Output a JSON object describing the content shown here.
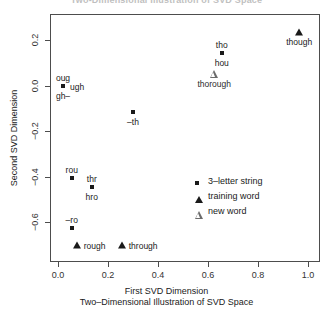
{
  "clipped_title": "Two-Dimensional Illustration of SVD Space",
  "axes": {
    "xlabel": "First SVD Dimension",
    "sublabel": "Two–Dimensional Illustration of SVD Space",
    "ylabel": "Second SVD Dimension",
    "xticks": [
      "0.0",
      "0.2",
      "0.4",
      "0.6",
      "0.8",
      "1.0"
    ],
    "yticks": [
      "0.2",
      "0.0",
      "−0.2",
      "−0.4",
      "−0.6"
    ]
  },
  "legend": {
    "items": [
      {
        "label": "3–letter string",
        "marker": "filled-square"
      },
      {
        "label": "training word",
        "marker": "filled-triangle"
      },
      {
        "label": "new word",
        "marker": "open-triangle"
      }
    ]
  },
  "chart_data": {
    "type": "scatter",
    "title": "Two-Dimensional Illustration of SVD Space",
    "xlabel": "First SVD Dimension",
    "ylabel": "Second SVD Dimension",
    "xlim": [
      -0.05,
      1.06
    ],
    "ylim": [
      -0.76,
      0.31
    ],
    "xticks": [
      0.0,
      0.2,
      0.4,
      0.6,
      0.8,
      1.0
    ],
    "yticks": [
      0.2,
      0.0,
      -0.2,
      -0.4,
      -0.6
    ],
    "grid": false,
    "legend_position": "center-right",
    "series": [
      {
        "name": "3–letter string",
        "marker": "filled-square",
        "color": "#1a1a1a",
        "points": [
          {
            "label": "oug",
            "x": 0.02,
            "y": 0.0,
            "label_pos": "above"
          },
          {
            "label": "ugh",
            "x": 0.02,
            "y": 0.0,
            "label_pos": "right"
          },
          {
            "label": "gh–",
            "x": 0.02,
            "y": 0.0,
            "label_pos": "below"
          },
          {
            "label": "tho",
            "x": 0.655,
            "y": 0.145,
            "label_pos": "above"
          },
          {
            "label": "hou",
            "x": 0.655,
            "y": 0.145,
            "label_pos": "below"
          },
          {
            "label": "–th",
            "x": 0.3,
            "y": -0.115,
            "label_pos": "below"
          },
          {
            "label": "rou",
            "x": 0.055,
            "y": -0.405,
            "label_pos": "above"
          },
          {
            "label": "thr",
            "x": 0.135,
            "y": -0.445,
            "label_pos": "above"
          },
          {
            "label": "hro",
            "x": 0.135,
            "y": -0.445,
            "label_pos": "below"
          },
          {
            "label": "–ro",
            "x": 0.055,
            "y": -0.625,
            "label_pos": "above"
          }
        ]
      },
      {
        "name": "training word",
        "marker": "filled-triangle",
        "color": "#1a1a1a",
        "points": [
          {
            "label": "though",
            "x": 0.965,
            "y": 0.235,
            "label_pos": "below"
          },
          {
            "label": "rough",
            "x": 0.075,
            "y": -0.7,
            "label_pos": "right"
          },
          {
            "label": "through",
            "x": 0.255,
            "y": -0.7,
            "label_pos": "right"
          }
        ]
      },
      {
        "name": "new word",
        "marker": "open-triangle",
        "color": "#6b6b6b",
        "points": [
          {
            "label": "thorough",
            "x": 0.625,
            "y": 0.05,
            "label_pos": "below"
          }
        ]
      }
    ]
  }
}
